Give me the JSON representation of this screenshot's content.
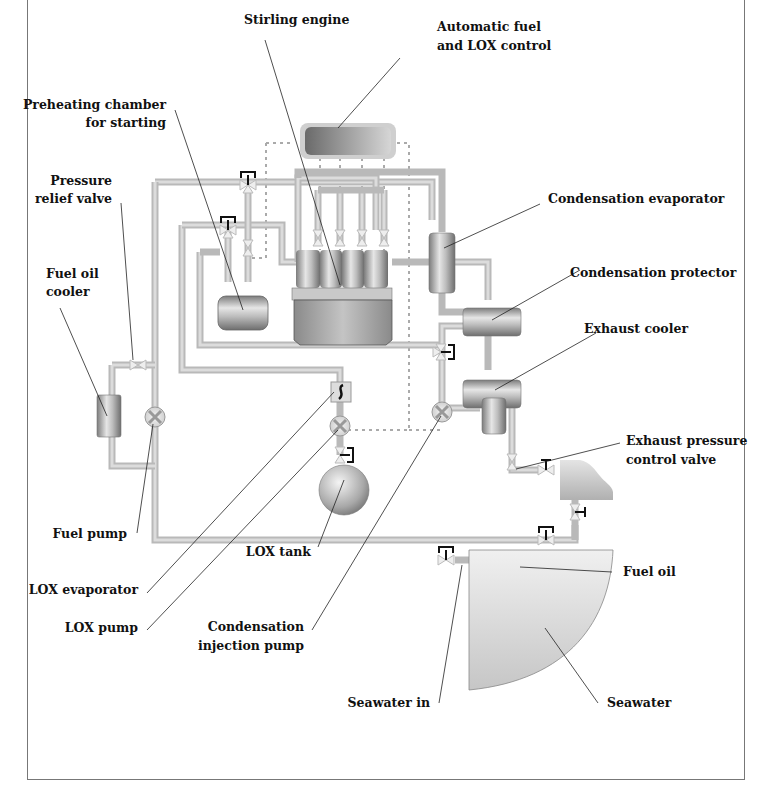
{
  "diagram": {
    "type": "process schematic",
    "labels": {
      "stirling_engine": "Stirling engine",
      "auto_control_line1": "Automatic fuel",
      "auto_control_line2": "and LOX control",
      "preheating_line1": "Preheating chamber",
      "preheating_line2": "for starting",
      "pressure_relief_line1": "Pressure",
      "pressure_relief_line2": "relief valve",
      "fuel_oil_cooler_line1": "Fuel oil",
      "fuel_oil_cooler_line2": "cooler",
      "condensation_evaporator": "Condensation evaporator",
      "condensation_protector": "Condensation protector",
      "exhaust_cooler": "Exhaust cooler",
      "exhaust_pcv_line1": "Exhaust pressure",
      "exhaust_pcv_line2": "control valve",
      "fuel_pump": "Fuel pump",
      "lox_tank": "LOX tank",
      "lox_evaporator": "LOX evaporator",
      "lox_pump": "LOX pump",
      "cond_injection_line1": "Condensation",
      "cond_injection_line2": "injection pump",
      "fuel_oil": "Fuel oil",
      "seawater_in": "Seawater in",
      "seawater": "Seawater"
    },
    "colors": {
      "pipe": "#b9b9b9",
      "component_metal": "#9a9a9a",
      "tank_fill": "#d8d8d8",
      "text": "#111111",
      "frame": "#777777"
    }
  }
}
